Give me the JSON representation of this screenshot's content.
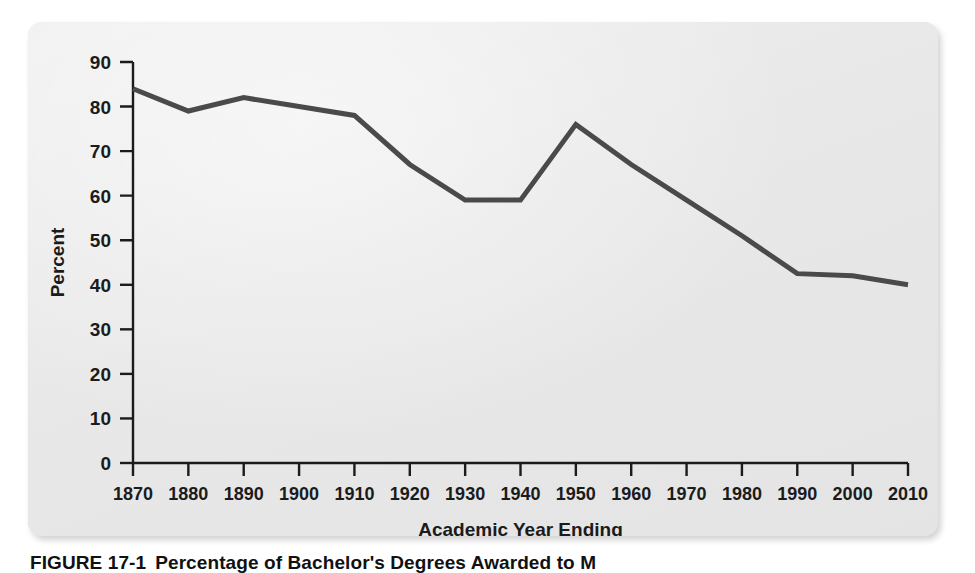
{
  "figure": {
    "caption_number": "FIGURE 17-1",
    "caption_text": "Percentage of Bachelor's Degrees Awarded to M",
    "card_background": "#ebebeb",
    "page_background": "#ffffff"
  },
  "chart_data": {
    "type": "line",
    "title": "",
    "xlabel": "Academic Year Ending",
    "ylabel": "Percent",
    "categories": [
      "1870",
      "1880",
      "1890",
      "1900",
      "1910",
      "1920",
      "1930",
      "1940",
      "1950",
      "1960",
      "1970",
      "1980",
      "1990",
      "2000",
      "2010"
    ],
    "values": [
      84,
      79,
      82,
      80,
      78,
      67,
      59,
      59,
      76,
      67,
      59,
      51,
      42.5,
      42,
      40
    ],
    "series": [
      {
        "name": "Percentage of bachelor's degrees awarded to men",
        "values": [
          84,
          79,
          82,
          80,
          78,
          67,
          59,
          59,
          76,
          67,
          59,
          51,
          42.5,
          42,
          40
        ],
        "color": "#4a4a4a"
      }
    ],
    "ylim": [
      0,
      90
    ],
    "ytick_values": [
      0,
      10,
      20,
      30,
      40,
      50,
      60,
      70,
      80,
      90
    ],
    "ytick_labels": [
      "0",
      "10",
      "20",
      "30",
      "40",
      "50",
      "60",
      "70",
      "80",
      "90"
    ],
    "xtick_labels": [
      "1870",
      "1880",
      "1890",
      "1900",
      "1910",
      "1920",
      "1930",
      "1940",
      "1950",
      "1960",
      "1970",
      "1980",
      "1990",
      "2000",
      "2010"
    ],
    "grid": false,
    "legend": "none",
    "line_color": "#4a4a4a",
    "axis_color": "#1b1b1b",
    "line_width": 5
  }
}
